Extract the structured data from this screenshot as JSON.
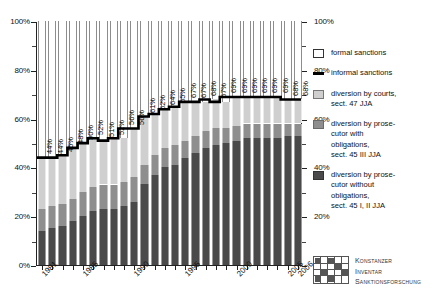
{
  "chart_data": {
    "type": "bar",
    "subtype": "stacked-bar-100-percent-with-line",
    "title": "",
    "xlabel": "",
    "ylabel": "",
    "ylim": [
      0,
      100
    ],
    "ytick_labels_left": [
      "100%",
      "80%",
      "60%",
      "40%",
      "20%",
      "0%"
    ],
    "ytick_labels_right": [
      "100%",
      "80%",
      "60%",
      "40%",
      "20%",
      "0%"
    ],
    "ytick_values": [
      100,
      80,
      60,
      40,
      20,
      0
    ],
    "grid": false,
    "legend_position": "right",
    "categories": [
      "1981",
      "1982",
      "1983",
      "1984",
      "1985",
      "1986",
      "1987",
      "1988",
      "1989",
      "1990",
      "1991",
      "1992",
      "1993",
      "1994",
      "1995",
      "1996",
      "1997",
      "1998",
      "1999",
      "2000",
      "2001",
      "2002",
      "2003",
      "2004",
      "2005",
      "2006"
    ],
    "xtick_labels_shown": [
      "1981",
      "1985",
      "1990",
      "1995",
      "2000",
      "2005",
      "2006"
    ],
    "series": [
      {
        "name": "diversion by prosecutor without obligations, sect. 45 I, II JJA",
        "key": "without",
        "color": "#4a4a4a",
        "values": [
          14,
          15,
          16,
          18,
          20,
          22,
          23,
          23,
          24,
          26,
          33,
          37,
          40,
          41,
          44,
          46,
          48,
          49,
          50,
          51,
          52,
          52,
          52,
          52,
          53,
          53
        ]
      },
      {
        "name": "diversion by prosecutor with obligations, sect. 45 III JJA",
        "key": "with",
        "color": "#8e8e8e",
        "values": [
          9,
          9,
          9,
          9,
          10,
          10,
          10,
          10,
          10,
          10,
          8,
          8,
          8,
          8,
          7,
          7,
          7,
          7,
          6,
          6,
          6,
          6,
          6,
          6,
          5,
          5
        ]
      },
      {
        "name": "diversion by courts, sect. 47 JJA",
        "key": "courts",
        "color": "#cfcfcf",
        "values": [
          21,
          20,
          20,
          21,
          20,
          20,
          18,
          19,
          18,
          20,
          20,
          17,
          16,
          16,
          16,
          14,
          12,
          12,
          11,
          12,
          11,
          11,
          11,
          11,
          10,
          10
        ]
      },
      {
        "name": "formal sanctions",
        "key": "formal",
        "color": "#ffffff",
        "values": [
          56,
          56,
          55,
          52,
          50,
          48,
          49,
          48,
          48,
          44,
          39,
          38,
          36,
          35,
          33,
          33,
          33,
          32,
          33,
          31,
          31,
          31,
          31,
          31,
          32,
          32
        ]
      }
    ],
    "line_series": {
      "name": "informal sanctions",
      "color": "#000000",
      "values": [
        44,
        44,
        45,
        48,
        50,
        52,
        51,
        52,
        56,
        56,
        61,
        62,
        64,
        65,
        67,
        67,
        68,
        67,
        69,
        69,
        69,
        69,
        69,
        69,
        68,
        68
      ],
      "data_labels": [
        "44%",
        "44%",
        "45%",
        "48%",
        "50%",
        "52%",
        "51%",
        "52%",
        "56%",
        "56%",
        "61%",
        "62%",
        "64%",
        "65%",
        "67%",
        "67%",
        "68%",
        "67%",
        "69%",
        "69%",
        "69%",
        "69%",
        "69%",
        "69%",
        "68%",
        "68%"
      ]
    }
  },
  "legend": {
    "items": [
      {
        "key": "formal",
        "label": "formal sanctions"
      },
      {
        "key": "informal",
        "label": "informal sanctions"
      },
      {
        "key": "courts",
        "label": "diversion by courts,\nsect. 47 JJA"
      },
      {
        "key": "with",
        "label": "diversion by prose-\ncutor with\nobligations,\nsect. 45 III JJA"
      },
      {
        "key": "without",
        "label": "diversion by prose-\ncutor without\nobligations,\nsect. 45 I, II JJA"
      }
    ]
  },
  "watermark": {
    "line1": "Konstanzer",
    "line2": "Inventar",
    "line3": "Sanktionsforschung"
  }
}
